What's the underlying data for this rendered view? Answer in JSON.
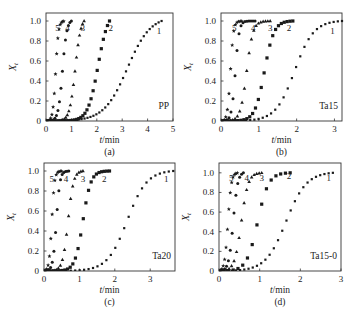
{
  "figure": {
    "background": "#ffffff",
    "ink_color": "#1a1a1a"
  },
  "chart_data": [
    {
      "type": "scatter",
      "panel": "(a)",
      "sample_label": "PP",
      "xlabel": "t/min",
      "ylabel": "Xt",
      "xlim": [
        0,
        5
      ],
      "ylim": [
        0,
        1.08
      ],
      "xticks": [
        0,
        1,
        2,
        3,
        4,
        5
      ],
      "yticks": [
        0,
        0.2,
        0.4,
        0.6,
        0.8,
        1.0
      ],
      "ytick_labels": [
        "0",
        "0.2",
        "0.4",
        "0.6",
        "0.8",
        "1.0"
      ],
      "frame_px": {
        "left": 46,
        "top": 13,
        "right": 173,
        "bottom": 121
      },
      "series": [
        {
          "name": "1",
          "marker": "square-small",
          "t_half": 3.2,
          "k": 2.2,
          "t_end": 4.55,
          "n_points": 40
        },
        {
          "name": "2",
          "marker": "square",
          "t_half": 2.05,
          "k": 5.0,
          "t_end": 2.5,
          "n_points": 32
        },
        {
          "name": "3",
          "marker": "triangle",
          "t_half": 1.15,
          "k": 9.0,
          "t_end": 1.5,
          "n_points": 26
        },
        {
          "name": "4",
          "marker": "dot",
          "t_half": 0.65,
          "k": 12.0,
          "t_end": 1.0,
          "n_points": 18
        },
        {
          "name": "5",
          "marker": "star",
          "t_half": 0.38,
          "k": 18.0,
          "t_end": 0.7,
          "n_points": 16
        }
      ],
      "curve_labels": [
        {
          "text": "5",
          "x": 0.45,
          "y": 0.93
        },
        {
          "text": "4",
          "x": 0.85,
          "y": 0.93
        },
        {
          "text": "3",
          "x": 1.45,
          "y": 0.93
        },
        {
          "text": "2",
          "x": 2.55,
          "y": 0.93
        },
        {
          "text": "1",
          "x": 4.45,
          "y": 0.9
        }
      ]
    },
    {
      "type": "scatter",
      "panel": "(b)",
      "sample_label": "Ta15",
      "xlabel": "t/min",
      "ylabel": "Xt",
      "xlim": [
        0,
        3.2
      ],
      "ylim": [
        0,
        1.08
      ],
      "xticks": [
        0,
        1,
        2,
        3
      ],
      "yticks": [
        0,
        0.2,
        0.4,
        0.6,
        0.8,
        1.0
      ],
      "ytick_labels": [
        "0",
        "0.2",
        "0.4",
        "0.6",
        "0.8",
        "1.0"
      ],
      "frame_px": {
        "left": 221,
        "top": 13,
        "right": 342,
        "bottom": 121
      },
      "series": [
        {
          "name": "1",
          "marker": "square-small",
          "t_half": 1.95,
          "k": 4.0,
          "t_end": 3.2,
          "n_points": 30
        },
        {
          "name": "2",
          "marker": "square",
          "t_half": 1.15,
          "k": 8.0,
          "t_end": 1.9,
          "n_points": 26
        },
        {
          "name": "3",
          "marker": "triangle",
          "t_half": 0.68,
          "k": 12.0,
          "t_end": 1.3,
          "n_points": 22
        },
        {
          "name": "4",
          "marker": "dot",
          "t_half": 0.38,
          "k": 20.0,
          "t_end": 0.9,
          "n_points": 18
        },
        {
          "name": "5",
          "marker": "star",
          "t_half": 0.25,
          "k": 25.0,
          "t_end": 0.55,
          "n_points": 14
        }
      ],
      "curve_labels": [
        {
          "text": "5",
          "x": 0.35,
          "y": 0.93
        },
        {
          "text": "4",
          "x": 0.85,
          "y": 0.93
        },
        {
          "text": "3",
          "x": 1.3,
          "y": 0.93
        },
        {
          "text": "2",
          "x": 1.8,
          "y": 0.93
        },
        {
          "text": "1",
          "x": 2.95,
          "y": 0.9
        }
      ]
    },
    {
      "type": "scatter",
      "panel": "(c)",
      "sample_label": "Ta20",
      "xlabel": "t/min",
      "ylabel": "Xt",
      "xlim": [
        0,
        3.7
      ],
      "ylim": [
        0,
        1.08
      ],
      "xticks": [
        0,
        1,
        2,
        3
      ],
      "yticks": [
        0,
        0.2,
        0.4,
        0.6,
        0.8,
        1.0
      ],
      "ytick_labels": [
        "0",
        "0.2",
        "0.4",
        "0.6",
        "0.8",
        "1.0"
      ],
      "frame_px": {
        "left": 44,
        "top": 163,
        "right": 175,
        "bottom": 271
      },
      "series": [
        {
          "name": "1",
          "marker": "square-small",
          "t_half": 2.35,
          "k": 3.6,
          "t_end": 3.65,
          "n_points": 30
        },
        {
          "name": "2",
          "marker": "square",
          "t_half": 1.1,
          "k": 9.0,
          "t_end": 1.85,
          "n_points": 26
        },
        {
          "name": "3",
          "marker": "triangle",
          "t_half": 0.68,
          "k": 13.0,
          "t_end": 1.1,
          "n_points": 20
        },
        {
          "name": "4",
          "marker": "dot",
          "t_half": 0.35,
          "k": 20.0,
          "t_end": 0.7,
          "n_points": 16
        },
        {
          "name": "5",
          "marker": "star",
          "t_half": 0.22,
          "k": 26.0,
          "t_end": 0.5,
          "n_points": 14
        }
      ],
      "curve_labels": [
        {
          "text": "5",
          "x": 0.22,
          "y": 0.92
        },
        {
          "text": "4",
          "x": 0.62,
          "y": 0.92
        },
        {
          "text": "3",
          "x": 1.1,
          "y": 0.92
        },
        {
          "text": "2",
          "x": 1.7,
          "y": 0.92
        },
        {
          "text": "1",
          "x": 3.45,
          "y": 0.92
        }
      ]
    },
    {
      "type": "scatter",
      "panel": "(d)",
      "sample_label": "Ta15-0",
      "xlabel": "t/min",
      "ylabel": "Xt",
      "xlim": [
        0,
        3
      ],
      "ylim": [
        0,
        1.1
      ],
      "xticks": [
        0,
        1,
        2,
        3
      ],
      "yticks": [
        0,
        0.2,
        0.4,
        0.6,
        0.8,
        1.0
      ],
      "ytick_labels": [
        "0",
        "0.2",
        "0.4",
        "0.6",
        "0.8",
        "1.0"
      ],
      "frame_px": {
        "left": 219,
        "top": 163,
        "right": 341,
        "bottom": 271
      },
      "series": [
        {
          "name": "1",
          "marker": "square-small",
          "t_half": 1.65,
          "k": 4.0,
          "t_end": 2.8,
          "n_points": 28
        },
        {
          "name": "2",
          "marker": "square",
          "t_half": 0.95,
          "k": 7.5,
          "t_end": 1.75,
          "n_points": 16
        },
        {
          "name": "3",
          "marker": "triangle",
          "t_half": 0.55,
          "k": 12.0,
          "t_end": 1.05,
          "n_points": 18
        },
        {
          "name": "4",
          "marker": "dot",
          "t_half": 0.35,
          "k": 18.0,
          "t_end": 0.6,
          "n_points": 14
        },
        {
          "name": "5",
          "marker": "star",
          "t_half": 0.22,
          "k": 24.0,
          "t_end": 0.45,
          "n_points": 14
        }
      ],
      "curve_labels": [
        {
          "text": "5",
          "x": 0.3,
          "y": 0.95
        },
        {
          "text": "4",
          "x": 0.68,
          "y": 0.95
        },
        {
          "text": "3",
          "x": 1.05,
          "y": 0.95
        },
        {
          "text": "2",
          "x": 1.72,
          "y": 0.97
        },
        {
          "text": "1",
          "x": 2.7,
          "y": 0.95
        }
      ]
    }
  ]
}
